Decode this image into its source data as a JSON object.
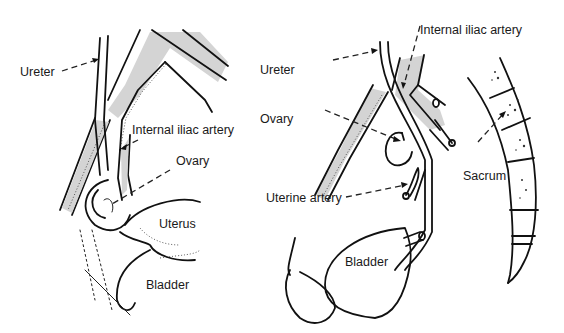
{
  "figure": {
    "panels": [
      {
        "id": "left",
        "labels": [
          {
            "key": "ureter",
            "text": "Ureter"
          },
          {
            "key": "internal_iliac_artery",
            "text": "Internal iliac artery"
          },
          {
            "key": "ovary",
            "text": "Ovary"
          },
          {
            "key": "uterus",
            "text": "Uterus"
          },
          {
            "key": "bladder",
            "text": "Bladder"
          }
        ]
      },
      {
        "id": "right",
        "labels": [
          {
            "key": "internal_iliac_artery",
            "text": "Internal iliac artery"
          },
          {
            "key": "ureter",
            "text": "Ureter"
          },
          {
            "key": "ovary",
            "text": "Ovary"
          },
          {
            "key": "sacrum",
            "text": "Sacrum"
          },
          {
            "key": "uterine_artery",
            "text": "Uterine artery"
          },
          {
            "key": "bladder",
            "text": "Bladder"
          }
        ]
      }
    ]
  }
}
